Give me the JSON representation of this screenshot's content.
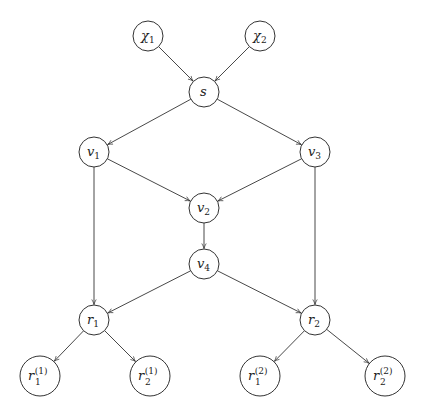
{
  "diagram": {
    "type": "directed-graph",
    "nodes": [
      {
        "id": "chi1",
        "label": "χ",
        "sub": "1",
        "sup": "",
        "x": 148,
        "y": 36,
        "r": 15
      },
      {
        "id": "chi2",
        "label": "χ",
        "sub": "2",
        "sup": "",
        "x": 260,
        "y": 36,
        "r": 15
      },
      {
        "id": "s",
        "label": "s",
        "sub": "",
        "sup": "",
        "x": 204,
        "y": 92,
        "r": 15
      },
      {
        "id": "v1",
        "label": "v",
        "sub": "1",
        "sup": "",
        "x": 94,
        "y": 152,
        "r": 15
      },
      {
        "id": "v3",
        "label": "v",
        "sub": "3",
        "sup": "",
        "x": 315,
        "y": 152,
        "r": 15
      },
      {
        "id": "v2",
        "label": "v",
        "sub": "2",
        "sup": "",
        "x": 204,
        "y": 208,
        "r": 15
      },
      {
        "id": "v4",
        "label": "v",
        "sub": "4",
        "sup": "",
        "x": 204,
        "y": 264,
        "r": 15
      },
      {
        "id": "r1",
        "label": "r",
        "sub": "1",
        "sup": "",
        "x": 94,
        "y": 320,
        "r": 15
      },
      {
        "id": "r2",
        "label": "r",
        "sub": "2",
        "sup": "",
        "x": 315,
        "y": 320,
        "r": 15
      },
      {
        "id": "r1_1",
        "label": "r",
        "sub": "1",
        "sup": "(1)",
        "x": 40,
        "y": 376,
        "r": 20
      },
      {
        "id": "r2_1",
        "label": "r",
        "sub": "2",
        "sup": "(1)",
        "x": 150,
        "y": 376,
        "r": 20
      },
      {
        "id": "r1_2",
        "label": "r",
        "sub": "1",
        "sup": "(2)",
        "x": 260,
        "y": 376,
        "r": 20
      },
      {
        "id": "r2_2",
        "label": "r",
        "sub": "2",
        "sup": "(2)",
        "x": 385,
        "y": 376,
        "r": 20
      }
    ],
    "edges": [
      {
        "from": "chi1",
        "to": "s"
      },
      {
        "from": "chi2",
        "to": "s"
      },
      {
        "from": "s",
        "to": "v1"
      },
      {
        "from": "s",
        "to": "v3"
      },
      {
        "from": "v1",
        "to": "v2"
      },
      {
        "from": "v3",
        "to": "v2"
      },
      {
        "from": "v2",
        "to": "v4"
      },
      {
        "from": "v1",
        "to": "r1"
      },
      {
        "from": "v3",
        "to": "r2"
      },
      {
        "from": "v4",
        "to": "r1"
      },
      {
        "from": "v4",
        "to": "r2"
      },
      {
        "from": "r1",
        "to": "r1_1"
      },
      {
        "from": "r1",
        "to": "r2_1"
      },
      {
        "from": "r2",
        "to": "r1_2"
      },
      {
        "from": "r2",
        "to": "r2_2"
      }
    ],
    "colors": {
      "stroke": "#333333",
      "text": "#222222",
      "background": "#ffffff"
    }
  }
}
